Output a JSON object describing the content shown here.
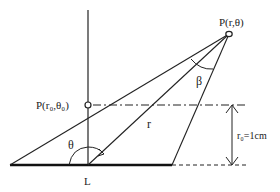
{
  "diagram": {
    "labels": {
      "point_p": "P(r,θ)",
      "point_p0": "P(r₀,θ₀)",
      "angle_beta": "β",
      "angle_theta": "θ",
      "radius_r": "r",
      "distance": "r₀=1cm",
      "line_L": "L"
    },
    "colors": {
      "stroke": "#222222",
      "background": "#ffffff"
    }
  }
}
